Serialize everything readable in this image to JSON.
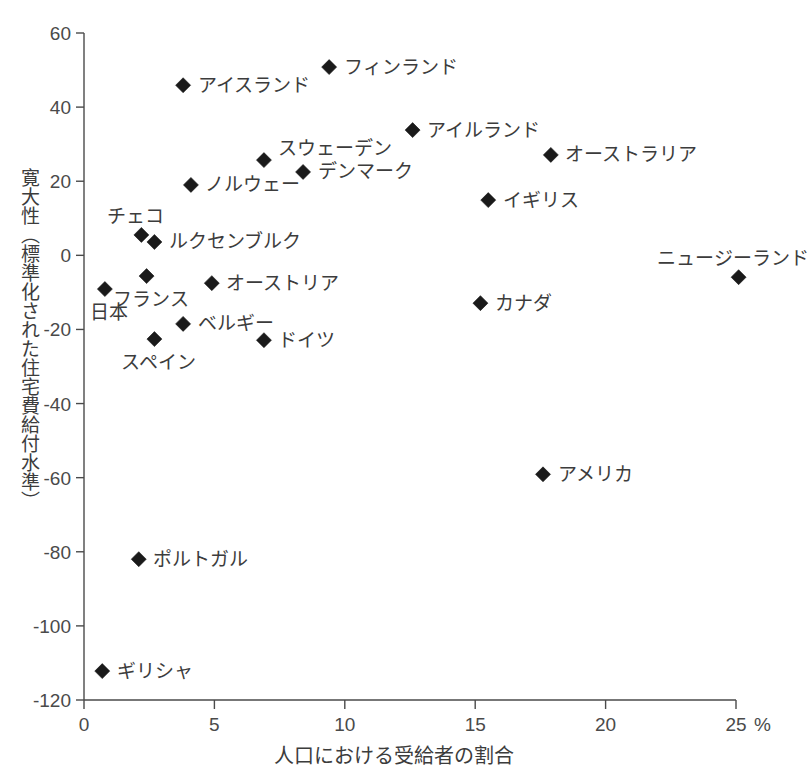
{
  "chart_data": {
    "type": "scatter",
    "title": "",
    "xlabel": "人口における受給者の割合",
    "ylabel": "寛大性（標準化された住宅費給付水準）",
    "x_unit_suffix": "%",
    "xlim": [
      0,
      25
    ],
    "ylim": [
      -120,
      60
    ],
    "xticks": [
      0,
      5,
      10,
      15,
      20,
      25
    ],
    "xtick_labels": [
      "0",
      "5",
      "10",
      "15",
      "20",
      "25"
    ],
    "yticks": [
      60,
      40,
      20,
      0,
      -20,
      -40,
      -60,
      -80,
      -100,
      -120
    ],
    "ytick_labels": [
      "60",
      "40",
      "20",
      "0",
      "-20",
      "-40",
      "-60",
      "-80",
      "-100",
      "-120"
    ],
    "grid": false,
    "legend": "none",
    "marker_shape": "diamond",
    "marker_color": "#1a1a1a",
    "points": [
      {
        "label": "フィンランド",
        "x": 9.4,
        "y": 50.8,
        "label_side": "right"
      },
      {
        "label": "アイスランド",
        "x": 3.8,
        "y": 45.9,
        "label_side": "right"
      },
      {
        "label": "アイルランド",
        "x": 12.6,
        "y": 33.8,
        "label_side": "right"
      },
      {
        "label": "スウェーデン",
        "x": 6.9,
        "y": 25.7,
        "label_side": "right-above"
      },
      {
        "label": "オーストラリア",
        "x": 17.9,
        "y": 27.1,
        "label_side": "right"
      },
      {
        "label": "デンマーク",
        "x": 8.4,
        "y": 22.5,
        "label_side": "right"
      },
      {
        "label": "ノルウェー",
        "x": 4.1,
        "y": 19.0,
        "label_side": "right"
      },
      {
        "label": "イギリス",
        "x": 15.5,
        "y": 14.9,
        "label_side": "right"
      },
      {
        "label": "チェコ",
        "x": 2.2,
        "y": 5.5,
        "label_side": "left-above"
      },
      {
        "label": "ルクセンブルク",
        "x": 2.7,
        "y": 3.6,
        "label_side": "right"
      },
      {
        "label": "ニュージーランド",
        "x": 25.1,
        "y": -5.9,
        "label_side": "left-above"
      },
      {
        "label": "フランス",
        "x": 2.4,
        "y": -5.6,
        "label_side": "below"
      },
      {
        "label": "オーストリア",
        "x": 4.9,
        "y": -7.5,
        "label_side": "right"
      },
      {
        "label": "日本",
        "x": 0.8,
        "y": -9.1,
        "label_side": "below"
      },
      {
        "label": "カナダ",
        "x": 15.2,
        "y": -12.9,
        "label_side": "right"
      },
      {
        "label": "ベルギー",
        "x": 3.8,
        "y": -18.5,
        "label_side": "right"
      },
      {
        "label": "スペイン",
        "x": 2.7,
        "y": -22.6,
        "label_side": "below"
      },
      {
        "label": "ドイツ",
        "x": 6.9,
        "y": -22.9,
        "label_side": "right"
      },
      {
        "label": "アメリカ",
        "x": 17.6,
        "y": -59.1,
        "label_side": "right"
      },
      {
        "label": "ポルトガル",
        "x": 2.1,
        "y": -82.0,
        "label_side": "right"
      },
      {
        "label": "ギリシャ",
        "x": 0.7,
        "y": -112.2,
        "label_side": "right"
      }
    ]
  }
}
